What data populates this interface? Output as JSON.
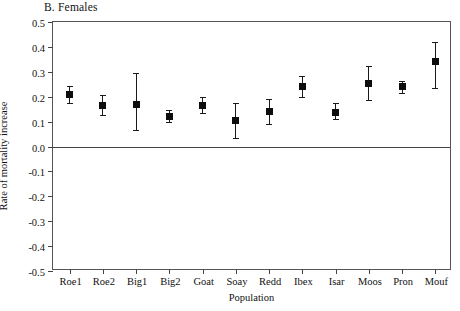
{
  "chart_data": {
    "type": "scatter",
    "title": "B. Females",
    "xlabel": "Population",
    "ylabel": "Rate of mortality increase",
    "ylim": [
      -0.5,
      0.5
    ],
    "grid": false,
    "legend": null,
    "zero_reference_line": 0.0,
    "error_bar_type": "confidence interval",
    "categories": [
      "Roe1",
      "Roe2",
      "Big1",
      "Big2",
      "Goat",
      "Soay",
      "Redd",
      "Ibex",
      "Isar",
      "Moos",
      "Pron",
      "Mouf"
    ],
    "values": [
      0.21,
      0.165,
      0.17,
      0.12,
      0.165,
      0.105,
      0.14,
      0.24,
      0.135,
      0.255,
      0.24,
      0.34
    ],
    "error_low": [
      0.175,
      0.125,
      0.065,
      0.1,
      0.135,
      0.035,
      0.09,
      0.2,
      0.11,
      0.185,
      0.215,
      0.235
    ],
    "error_high": [
      0.245,
      0.205,
      0.295,
      0.145,
      0.2,
      0.175,
      0.19,
      0.285,
      0.175,
      0.325,
      0.265,
      0.42
    ],
    "ytick_labels": [
      "0.5",
      "0.4",
      "0.3",
      "0.2",
      "0.1",
      "0.0",
      "-0.1",
      "-0.2",
      "-0.3",
      "-0.4",
      "-0.5"
    ],
    "ytick_values": [
      0.5,
      0.4,
      0.3,
      0.2,
      0.1,
      0.0,
      -0.1,
      -0.2,
      -0.3,
      -0.4,
      -0.5
    ],
    "marker_color": "#0d0d0d",
    "axis_color": "#555555"
  }
}
